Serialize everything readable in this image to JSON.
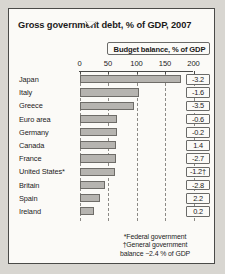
{
  "chart_data": {
    "type": "bar",
    "title": "Gross government debt, % of GDP, 2007",
    "orientation": "horizontal",
    "xlabel": "",
    "ylabel": "",
    "xlim": [
      0,
      200
    ],
    "ticks": [
      0,
      50,
      100,
      150,
      200
    ],
    "tick_labels": [
      "0",
      "50",
      "100",
      "150",
      "200"
    ],
    "grid": true,
    "grid_style": "dashed-vertical",
    "legend": "none",
    "categories": [
      "Japan",
      "Italy",
      "Greece",
      "Euro area",
      "Germany",
      "Canada",
      "France",
      "United States*",
      "Britain",
      "Spain",
      "Ireland"
    ],
    "values": [
      178,
      104,
      95,
      66,
      65,
      64,
      64,
      62,
      44,
      36,
      25
    ],
    "annotation_column": {
      "header": "Budget balance, % of GDP",
      "labels": [
        "-3.2",
        "-1.6",
        "-3.5",
        "-0.6",
        "-0.2",
        "1.4",
        "-2.7",
        "-1.2†",
        "-2.8",
        "2.2",
        "0.2"
      ],
      "values": [
        -3.2,
        -1.6,
        -3.5,
        -0.6,
        -0.2,
        1.4,
        -2.7,
        -1.2,
        -2.8,
        2.2,
        0.2
      ]
    },
    "footnotes": [
      "*Federal government",
      "†General government",
      "balance −2.4 % of GDP"
    ],
    "colors": {
      "bar_fill": "#b6b4b0",
      "bar_stroke": "#6e6c68",
      "background": "#fbfaf7",
      "border": "#4a4a48",
      "text": "#1b1b1b",
      "gridline": "#8c8a86"
    }
  }
}
